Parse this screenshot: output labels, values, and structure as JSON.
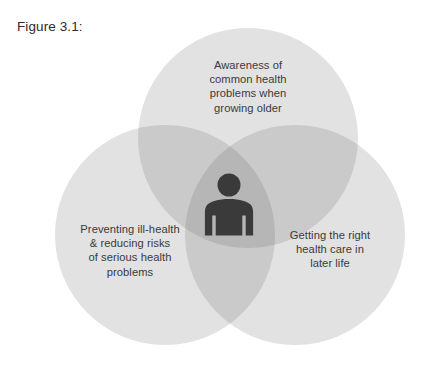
{
  "figure": {
    "caption": "Figure 3.1:"
  },
  "diagram": {
    "type": "venn-3-circle",
    "center_icon": "person-icon",
    "circles": [
      {
        "id": "top",
        "position": "top",
        "label": "Awareness of\ncommon health\nproblems when\ngrowing older",
        "cx": 248,
        "cy": 138,
        "r": 110
      },
      {
        "id": "left",
        "position": "bottom-left",
        "label": "Preventing ill-health\n& reducing risks\nof serious health\nproblems",
        "cx": 165,
        "cy": 235,
        "r": 110
      },
      {
        "id": "right",
        "position": "bottom-right",
        "label": "Getting the right\nhealth care in\nlater life",
        "cx": 295,
        "cy": 235,
        "r": 110
      }
    ],
    "colors": {
      "circle_fill": "#e2e2e2",
      "overlap_two": "#cacaca",
      "overlap_three": "#b6b6b6",
      "icon_fill": "#3a3a3a",
      "text": "#3a3a3a",
      "caption_text": "#2b2b2b",
      "background": "#ffffff"
    }
  }
}
